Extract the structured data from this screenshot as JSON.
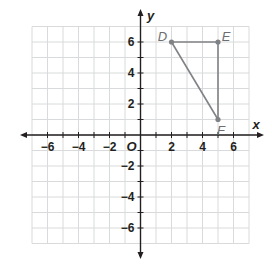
{
  "diagram": {
    "type": "coordinate-plane",
    "x_axis": {
      "label": "x",
      "min": -7,
      "max": 7,
      "tick_labels": [
        "-6",
        "-4",
        "-2",
        "2",
        "4",
        "6"
      ]
    },
    "y_axis": {
      "label": "y",
      "min": -7,
      "max": 7,
      "tick_labels": [
        "6",
        "4",
        "2",
        "-2",
        "-4",
        "-6"
      ]
    },
    "origin_label": "O",
    "points": [
      {
        "label": "D",
        "x": 2,
        "y": 6
      },
      {
        "label": "E",
        "x": 5,
        "y": 6
      },
      {
        "label": "F",
        "x": 5,
        "y": 1
      }
    ],
    "segments": [
      [
        "D",
        "E"
      ],
      [
        "E",
        "F"
      ],
      [
        "F",
        "D"
      ]
    ],
    "colors": {
      "grid": "#d9dadb",
      "axis": "#231f20",
      "shape": "#808285",
      "point": "#808285"
    }
  }
}
